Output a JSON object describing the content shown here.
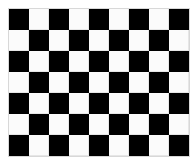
{
  "board": {
    "rows": 7,
    "cols": 9,
    "first_cell": "dark",
    "colors": {
      "dark": "#000000",
      "light": "#fbfbfb",
      "grid_line": "#e6e6e6"
    }
  }
}
